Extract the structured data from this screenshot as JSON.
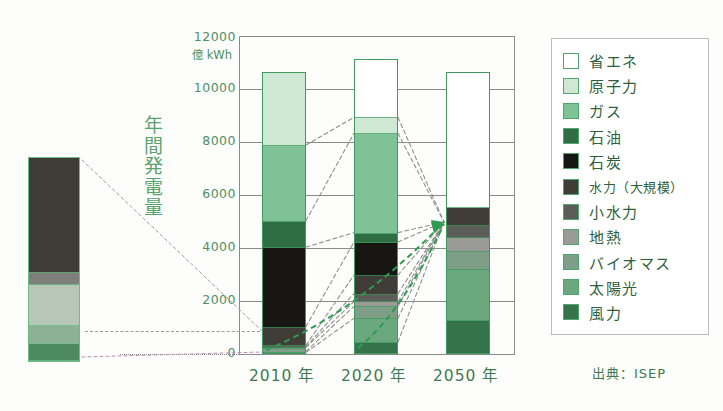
{
  "axis": {
    "y_unit": "億 kWh",
    "y_ticks": [
      "12000",
      "10000",
      "8000",
      "6000",
      "4000",
      "2000",
      "0"
    ],
    "y_label_vertical": "年間発電量",
    "y_label_chars": [
      "年",
      "間",
      "発",
      "電",
      "量"
    ],
    "x_labels": [
      "2010 年",
      "2020 年",
      "2050 年"
    ]
  },
  "legend": {
    "items": [
      {
        "label": "省エネ",
        "color": "#ffffff"
      },
      {
        "label": "原子力",
        "color": "#cfe8d4"
      },
      {
        "label": "ガス",
        "color": "#7fc295"
      },
      {
        "label": "石油",
        "color": "#2f6d43"
      },
      {
        "label": "石炭",
        "color": "#171612"
      },
      {
        "label": "水力（大規模）",
        "color": "#403c37"
      },
      {
        "label": "小水力",
        "color": "#5c5c58"
      },
      {
        "label": "地熱",
        "color": "#9a9a96"
      },
      {
        "label": "バイオマス",
        "color": "#7f9e88"
      },
      {
        "label": "太陽光",
        "color": "#6ba87e"
      },
      {
        "label": "風力",
        "color": "#35734a"
      }
    ]
  },
  "source": "出典：ISEP",
  "chart_data": {
    "type": "bar",
    "title": "",
    "subtitle": "",
    "xlabel": "",
    "ylabel": "年間発電量",
    "yunit": "億 kWh",
    "ylim": [
      0,
      12000
    ],
    "ytick_values": [
      0,
      2000,
      4000,
      6000,
      8000,
      10000,
      12000
    ],
    "grid": true,
    "legend_position": "right",
    "stacked": true,
    "categories": [
      "2010 年",
      "2020 年",
      "2050 年"
    ],
    "totals": [
      10650,
      10650,
      10650
    ],
    "series": [
      {
        "name": "風力",
        "color": "#35734a",
        "values": [
          60,
          450,
          1300
        ]
      },
      {
        "name": "太陽光",
        "color": "#6ba87e",
        "values": [
          35,
          900,
          1900
        ]
      },
      {
        "name": "バイオマス",
        "color": "#7f9e88",
        "values": [
          150,
          450,
          700
        ]
      },
      {
        "name": "地熱",
        "color": "#9a9a96",
        "values": [
          30,
          180,
          500
        ]
      },
      {
        "name": "小水力",
        "color": "#5c5c58",
        "values": [
          60,
          300,
          450
        ]
      },
      {
        "name": "水力（大規模）",
        "color": "#403c37",
        "values": [
          700,
          700,
          700
        ]
      },
      {
        "name": "石炭",
        "color": "#171612",
        "values": [
          3000,
          1250,
          0
        ]
      },
      {
        "name": "石油",
        "color": "#2f6d43",
        "values": [
          1000,
          350,
          0
        ]
      },
      {
        "name": "ガス",
        "color": "#7fc295",
        "values": [
          2850,
          3750,
          0
        ]
      },
      {
        "name": "原子力",
        "color": "#cfe8d4",
        "values": [
          2750,
          600,
          0
        ]
      },
      {
        "name": "省エネ",
        "color": "#ffffff",
        "values": [
          0,
          2200,
          5100
        ]
      }
    ],
    "inset": {
      "label": "",
      "note": "small reference bar at left",
      "segments": [
        {
          "name": "dark",
          "color": "#403c37",
          "fraction": 0.565
        },
        {
          "name": "mid-gray",
          "color": "#7e7f7a",
          "fraction": 0.06
        },
        {
          "name": "light-gray",
          "color": "#b6c7b8",
          "fraction": 0.205
        },
        {
          "name": "mid-green",
          "color": "#8bb294",
          "fraction": 0.085
        },
        {
          "name": "dark-green",
          "color": "#4e8a5f",
          "fraction": 0.085
        }
      ]
    },
    "annotations": [
      {
        "type": "arrow",
        "label": "growth-arrow",
        "color": "#2f9a52",
        "from": "2010 renewables",
        "to": "2050 renewables"
      },
      {
        "type": "dashed-connectors",
        "color": "#8f8f8f",
        "note": "segment boundaries linked between 2010, 2020 and 2050 bars"
      }
    ]
  }
}
